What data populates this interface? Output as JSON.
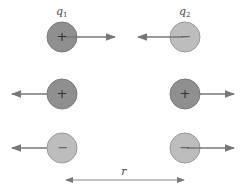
{
  "labels": {
    "q1": "q",
    "q1_sub": "1",
    "q2": "q",
    "q2_sub": "2",
    "distance": "r"
  },
  "colors": {
    "positive_fill": "#8f8f8f",
    "negative_fill": "#bdbdbd",
    "stroke": "#7a7a7a",
    "arrow": "#777777",
    "sign": "#333333"
  },
  "rows": [
    {
      "q1_sign": "+",
      "q2_sign": "−",
      "q1_force": "right",
      "q2_force": "left",
      "interaction": "attraction"
    },
    {
      "q1_sign": "+",
      "q2_sign": "+",
      "q1_force": "left",
      "q2_force": "right",
      "interaction": "repulsion"
    },
    {
      "q1_sign": "−",
      "q2_sign": "−",
      "q1_force": "left",
      "q2_force": "right",
      "interaction": "repulsion"
    }
  ]
}
